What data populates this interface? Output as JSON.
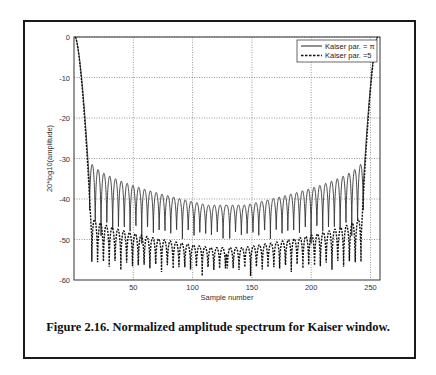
{
  "caption": "Figure 2.16. Normalized amplitude spectrum for Kaiser window.",
  "chart_data": {
    "type": "line",
    "title": "",
    "xlabel": "Sample number",
    "ylabel": "20*log10(amplitude)",
    "xlim": [
      0,
      258
    ],
    "ylim": [
      -60,
      0
    ],
    "xticks": [
      50,
      100,
      150,
      200,
      250
    ],
    "yticks": [
      0,
      -10,
      -20,
      -30,
      -40,
      -50,
      -60
    ],
    "grid": true,
    "legend_position": "top-right",
    "series": [
      {
        "name": "Kaiser par. = π",
        "legend_label": "Kaiser par. = π",
        "style": "solid",
        "mainlobe_width": 12,
        "sidelobe_period": 4.9,
        "sidelobe_peaks_edge": -30,
        "sidelobe_peaks_center": -41.5,
        "null_level": -51
      },
      {
        "name": "Kaiser par. = 5",
        "legend_label": "Kaiser par. =5",
        "style": "dashed",
        "mainlobe_width": 14,
        "sidelobe_period": 4.9,
        "sidelobe_peaks_edge": -44,
        "sidelobe_peaks_center": -52,
        "null_level": -59
      }
    ]
  }
}
